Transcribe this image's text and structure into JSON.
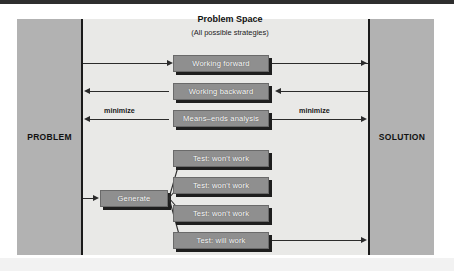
{
  "diagram": {
    "title": "Problem Space",
    "subtitle": "(All possible strategies)",
    "left_pillar_label": "PROBLEM",
    "right_pillar_label": "SOLUTION",
    "colors": {
      "pillar": "#b2b2b2",
      "field": "#e9e9e7",
      "node_fill": "#8f8f8f",
      "node_text": "#ffffff",
      "line": "#2b2b2b",
      "rule": "#1a1a1a",
      "page": "#ffffff"
    },
    "strategies": [
      {
        "label": "Working forward",
        "direction": "problem-to-solution"
      },
      {
        "label": "Working backward",
        "direction": "solution-to-problem"
      },
      {
        "label": "Means–ends analysis",
        "direction": "bidirectional"
      }
    ],
    "generate_node": {
      "label": "Generate"
    },
    "tests": [
      {
        "label": "Test: won't work",
        "outcome": "fail"
      },
      {
        "label": "Test: won't work",
        "outcome": "fail"
      },
      {
        "label": "Test: won't work",
        "outcome": "fail"
      },
      {
        "label": "Test: will work",
        "outcome": "pass"
      }
    ],
    "edge_labels": {
      "left_minimize": "minimize",
      "right_minimize": "minimize"
    }
  }
}
